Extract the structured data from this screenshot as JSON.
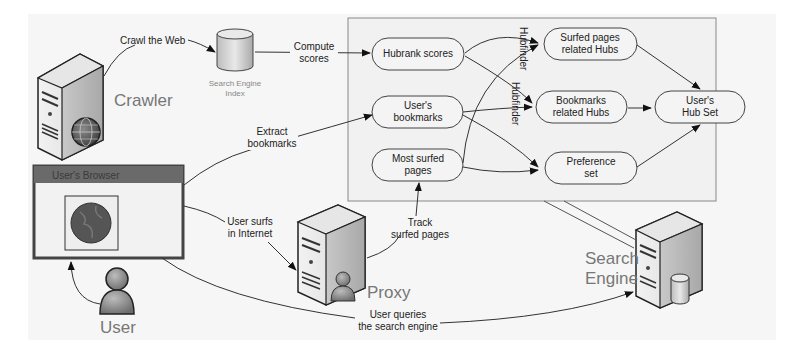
{
  "diagram": {
    "actors": {
      "crawler": "Crawler",
      "user": "User",
      "proxy": "Proxy",
      "search_engine_line1": "Search",
      "search_engine_line2": "Engine"
    },
    "index": {
      "line1": "Search Engine",
      "line2": "Index"
    },
    "browser": {
      "title": "User's Browser"
    },
    "edge_labels": {
      "crawl": "Crawl the Web",
      "compute_1": "Compute",
      "compute_2": "scores",
      "extract_1": "Extract",
      "extract_2": "bookmarks",
      "surfs_1": "User surfs",
      "surfs_2": "in Internet",
      "track_1": "Track",
      "track_2": "surfed pages",
      "queries_1": "User queries",
      "queries_2": "the search engine",
      "hubfinder_a": "Hubfinder",
      "hubfinder_b": "Hubfinder"
    },
    "nodes": {
      "hubrank": [
        "Hubrank scores"
      ],
      "bookmarks": [
        "User's",
        "bookmarks"
      ],
      "most_surfed": [
        "Most surfed",
        "pages"
      ],
      "surfed_hubs": [
        "Surfed pages",
        "related Hubs"
      ],
      "bookmark_hubs": [
        "Bookmarks",
        "related Hubs"
      ],
      "preference": [
        "Preference",
        "set"
      ],
      "hub_set": [
        "User's",
        "Hub Set"
      ]
    }
  }
}
